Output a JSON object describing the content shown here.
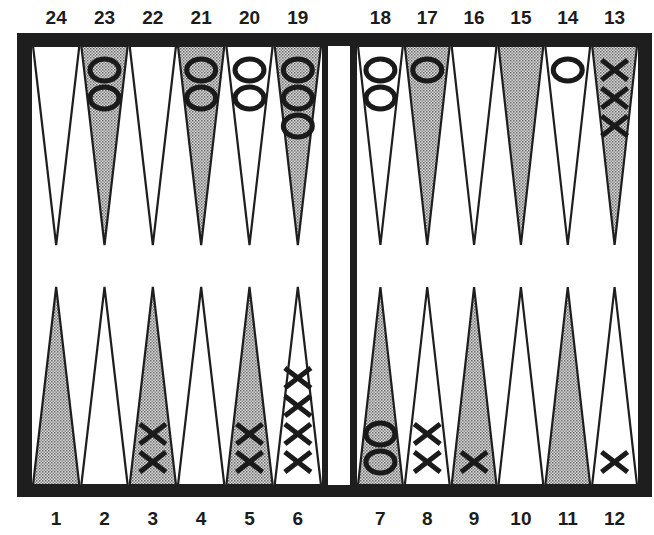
{
  "board": {
    "colors": {
      "frame": "#1e1e1e",
      "light_point": "#ffffff",
      "dark_point": "#b4b4b4",
      "checker_stroke": "#1a1a1a"
    },
    "top_labels": [
      "24",
      "23",
      "22",
      "21",
      "20",
      "19",
      "18",
      "17",
      "16",
      "15",
      "14",
      "13"
    ],
    "bottom_labels": [
      "1",
      "2",
      "3",
      "4",
      "5",
      "6",
      "7",
      "8",
      "9",
      "10",
      "11",
      "12"
    ],
    "points": [
      {
        "number": 1,
        "shade": "dark",
        "checker": null,
        "count": 0
      },
      {
        "number": 2,
        "shade": "light",
        "checker": null,
        "count": 0
      },
      {
        "number": 3,
        "shade": "dark",
        "checker": "X",
        "count": 2
      },
      {
        "number": 4,
        "shade": "light",
        "checker": null,
        "count": 0
      },
      {
        "number": 5,
        "shade": "dark",
        "checker": "X",
        "count": 2
      },
      {
        "number": 6,
        "shade": "light",
        "checker": "X",
        "count": 4
      },
      {
        "number": 7,
        "shade": "dark",
        "checker": "O",
        "count": 2
      },
      {
        "number": 8,
        "shade": "light",
        "checker": "X",
        "count": 2
      },
      {
        "number": 9,
        "shade": "dark",
        "checker": "X",
        "count": 1
      },
      {
        "number": 10,
        "shade": "light",
        "checker": null,
        "count": 0
      },
      {
        "number": 11,
        "shade": "dark",
        "checker": null,
        "count": 0
      },
      {
        "number": 12,
        "shade": "light",
        "checker": "X",
        "count": 1
      },
      {
        "number": 13,
        "shade": "dark",
        "checker": "X",
        "count": 3
      },
      {
        "number": 14,
        "shade": "light",
        "checker": "O",
        "count": 1
      },
      {
        "number": 15,
        "shade": "dark",
        "checker": null,
        "count": 0
      },
      {
        "number": 16,
        "shade": "light",
        "checker": null,
        "count": 0
      },
      {
        "number": 17,
        "shade": "dark",
        "checker": "O",
        "count": 1
      },
      {
        "number": 18,
        "shade": "light",
        "checker": "O",
        "count": 2
      },
      {
        "number": 19,
        "shade": "dark",
        "checker": "O",
        "count": 3
      },
      {
        "number": 20,
        "shade": "light",
        "checker": "O",
        "count": 2
      },
      {
        "number": 21,
        "shade": "dark",
        "checker": "O",
        "count": 2
      },
      {
        "number": 22,
        "shade": "light",
        "checker": null,
        "count": 0
      },
      {
        "number": 23,
        "shade": "dark",
        "checker": "O",
        "count": 2
      },
      {
        "number": 24,
        "shade": "light",
        "checker": null,
        "count": 0
      }
    ],
    "bar": {
      "checkers": []
    }
  }
}
